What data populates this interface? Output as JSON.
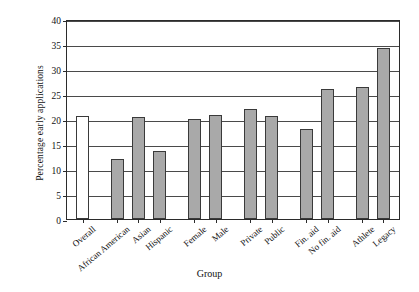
{
  "chart_data": {
    "type": "bar",
    "title": "",
    "xlabel": "Group",
    "ylabel": "Percentage early applications",
    "categories": [
      "Overall",
      "African American",
      "Asian",
      "Hispanic",
      "Female",
      "Male",
      "Private",
      "Public",
      "Fin. aid",
      "No fin. aid",
      "Athlete",
      "Legacy"
    ],
    "values": [
      20.7,
      12.0,
      20.4,
      13.6,
      20.0,
      20.8,
      22.0,
      20.6,
      18.0,
      26.1,
      26.4,
      34.3
    ],
    "ylim": [
      0,
      40
    ],
    "ytick_labels": [
      "0",
      "5",
      "10",
      "15",
      "20",
      "25",
      "30",
      "35",
      "40"
    ],
    "ytick_values": [
      0,
      5,
      10,
      15,
      20,
      25,
      30,
      35,
      40
    ],
    "grid": "horizontal",
    "legend": "none",
    "bar_colors": [
      "#ffffff",
      "#a9a9a9",
      "#a9a9a9",
      "#a9a9a9",
      "#a9a9a9",
      "#a9a9a9",
      "#a9a9a9",
      "#a9a9a9",
      "#a9a9a9",
      "#a9a9a9",
      "#a9a9a9",
      "#a9a9a9"
    ],
    "bar_edge_color": "#3a3a3a",
    "axis_color": "#2b2b2b",
    "grid_color": "#4a4a4a",
    "group_gaps_after": [
      0,
      3,
      5,
      7,
      9
    ]
  }
}
